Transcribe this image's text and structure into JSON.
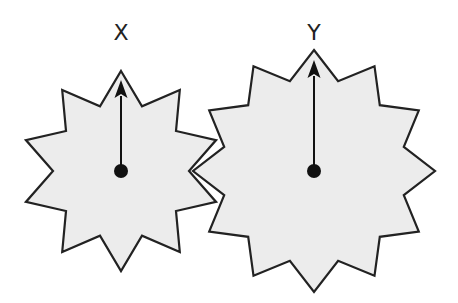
{
  "diagram": {
    "type": "gear-train",
    "colors": {
      "background": "#ffffff",
      "gear_fill": "#ececec",
      "gear_stroke": "#222222",
      "arrow": "#111111",
      "pivot": "#111111"
    },
    "gears": [
      {
        "id": "X",
        "label": "X",
        "teeth": 10,
        "center": [
          121,
          171
        ],
        "outer_radius": 100,
        "inner_radius": 68,
        "label_position": [
          121,
          40
        ],
        "arrow": {
          "direction": "up",
          "tip_y": 80
        }
      },
      {
        "id": "Y",
        "label": "Y",
        "teeth": 12,
        "center": [
          314,
          171
        ],
        "outer_radius": 121,
        "inner_radius": 93,
        "label_position": [
          314,
          40
        ],
        "arrow": {
          "direction": "up",
          "tip_y": 60
        }
      }
    ],
    "meshing": "X and Y teeth interlock at the point between the gears"
  }
}
